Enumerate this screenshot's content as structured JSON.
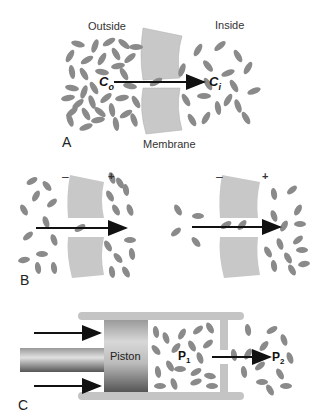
{
  "panel_a": {
    "letter": "A",
    "outside_label": "Outside",
    "inside_label": "Inside",
    "membrane_label": "Membrane",
    "co_label": "C",
    "co_sub": "o",
    "ci_label": "C",
    "ci_sub": "i"
  },
  "panel_b": {
    "letter": "B",
    "neg_sign": "–",
    "pos_sign": "+"
  },
  "panel_c": {
    "letter": "C",
    "piston_label": "Piston",
    "p1_label": "P",
    "p1_sub": "1",
    "p2_label": "P",
    "p2_sub": "2"
  },
  "colors": {
    "membrane": "#c8c8c8",
    "molecule": "#8a8a8a",
    "arrow": "#111111",
    "cylinder": "#c4c4c4"
  }
}
